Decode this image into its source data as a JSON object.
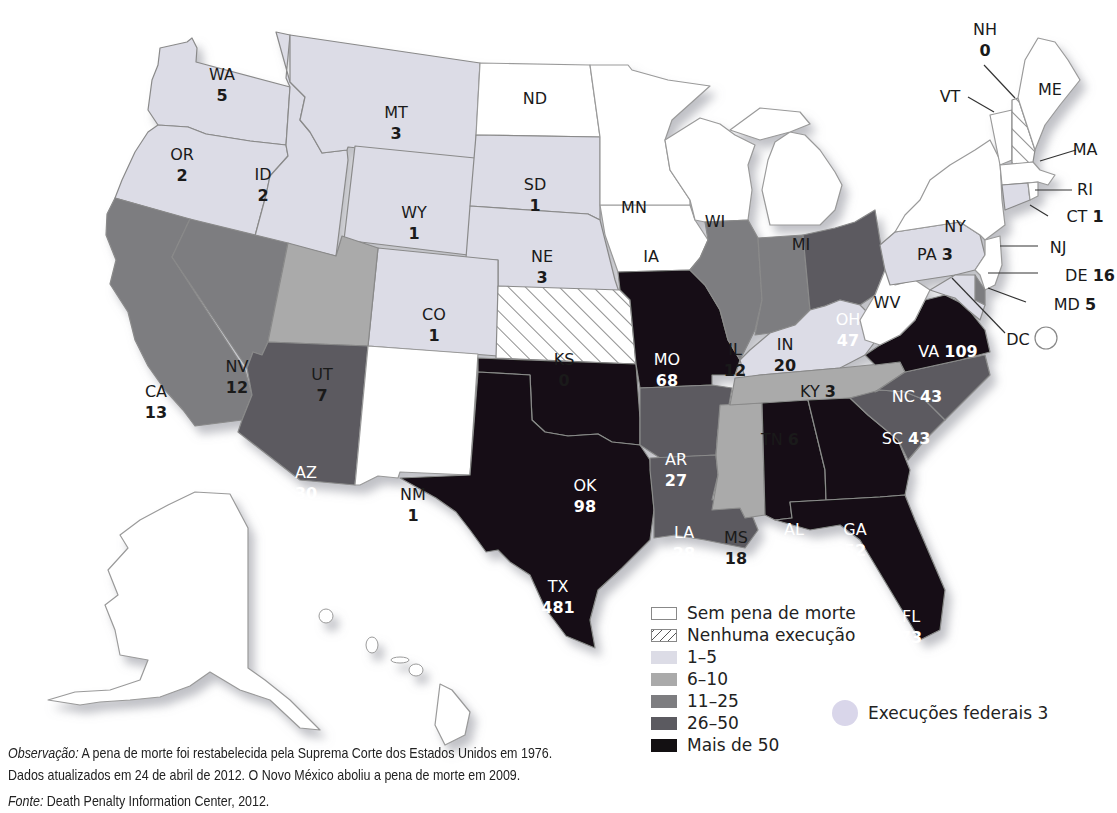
{
  "chart_data": {
    "type": "choropleth-map",
    "title": "",
    "legend": [
      {
        "key": "none",
        "label": "Sem pena de morte",
        "color": "#ffffff",
        "pattern": "none"
      },
      {
        "key": "zero",
        "label": "Nenhuma execução",
        "color": "#ffffff",
        "pattern": "hatch"
      },
      {
        "key": "c1",
        "label": "1–5",
        "color": "#dcdce6"
      },
      {
        "key": "c2",
        "label": "6–10",
        "color": "#aaaaaa"
      },
      {
        "key": "c3",
        "label": "11–25",
        "color": "#7d7d80"
      },
      {
        "key": "c4",
        "label": "26–50",
        "color": "#5b5a60"
      },
      {
        "key": "c5",
        "label": "Mais de 50",
        "color": "#131012"
      }
    ],
    "states": [
      {
        "code": "WA",
        "value": 5,
        "category": "1–5"
      },
      {
        "code": "OR",
        "value": 2,
        "category": "1–5"
      },
      {
        "code": "ID",
        "value": 2,
        "category": "1–5"
      },
      {
        "code": "MT",
        "value": 3,
        "category": "1–5"
      },
      {
        "code": "WY",
        "value": 1,
        "category": "1–5"
      },
      {
        "code": "SD",
        "value": 1,
        "category": "1–5"
      },
      {
        "code": "NE",
        "value": 3,
        "category": "1–5"
      },
      {
        "code": "CO",
        "value": 1,
        "category": "1–5"
      },
      {
        "code": "PA",
        "value": 3,
        "category": "1–5"
      },
      {
        "code": "KY",
        "value": 3,
        "category": "1–5"
      },
      {
        "code": "CT",
        "value": 1,
        "category": "1–5"
      },
      {
        "code": "MD",
        "value": 5,
        "category": "1–5"
      },
      {
        "code": "UT",
        "value": 7,
        "category": "6–10"
      },
      {
        "code": "TN",
        "value": 6,
        "category": "6–10"
      },
      {
        "code": "CA",
        "value": 13,
        "category": "11–25"
      },
      {
        "code": "NV",
        "value": 12,
        "category": "11–25"
      },
      {
        "code": "IL",
        "value": 12,
        "category": "11–25"
      },
      {
        "code": "IN",
        "value": 20,
        "category": "11–25"
      },
      {
        "code": "MS",
        "value": 18,
        "category": "11–25"
      },
      {
        "code": "DE",
        "value": 16,
        "category": "11–25"
      },
      {
        "code": "AZ",
        "value": 30,
        "category": "26–50"
      },
      {
        "code": "AR",
        "value": 27,
        "category": "26–50"
      },
      {
        "code": "LA",
        "value": 28,
        "category": "26–50"
      },
      {
        "code": "OH",
        "value": 47,
        "category": "26–50"
      },
      {
        "code": "NC",
        "value": 43,
        "category": "26–50"
      },
      {
        "code": "SC",
        "value": 43,
        "category": "26–50"
      },
      {
        "code": "MO",
        "value": 68,
        "category": "Mais de 50"
      },
      {
        "code": "OK",
        "value": 98,
        "category": "Mais de 50"
      },
      {
        "code": "TX",
        "value": 481,
        "category": "Mais de 50"
      },
      {
        "code": "AL",
        "value": 55,
        "category": "Mais de 50"
      },
      {
        "code": "GA",
        "value": 52,
        "category": "Mais de 50"
      },
      {
        "code": "FL",
        "value": 73,
        "category": "Mais de 50"
      },
      {
        "code": "VA",
        "value": 109,
        "category": "Mais de 50"
      },
      {
        "code": "KS",
        "value": 0,
        "category": "Nenhuma execução"
      },
      {
        "code": "NH",
        "value": 0,
        "category": "Nenhuma execução"
      },
      {
        "code": "NM",
        "value": 1,
        "category": "Sem pena de morte"
      },
      {
        "code": "ND",
        "value": null,
        "category": "Sem pena de morte"
      },
      {
        "code": "MN",
        "value": null,
        "category": "Sem pena de morte"
      },
      {
        "code": "WI",
        "value": null,
        "category": "Sem pena de morte"
      },
      {
        "code": "MI",
        "value": null,
        "category": "Sem pena de morte"
      },
      {
        "code": "IA",
        "value": null,
        "category": "Sem pena de morte"
      },
      {
        "code": "WV",
        "value": null,
        "category": "Sem pena de morte"
      },
      {
        "code": "NY",
        "value": null,
        "category": "Sem pena de morte"
      },
      {
        "code": "VT",
        "value": null,
        "category": "Sem pena de morte"
      },
      {
        "code": "ME",
        "value": null,
        "category": "Sem pena de morte"
      },
      {
        "code": "MA",
        "value": null,
        "category": "Sem pena de morte"
      },
      {
        "code": "RI",
        "value": null,
        "category": "Sem pena de morte"
      },
      {
        "code": "NJ",
        "value": null,
        "category": "Sem pena de morte"
      },
      {
        "code": "DC",
        "value": null,
        "category": "Sem pena de morte"
      },
      {
        "code": "AK",
        "value": null,
        "category": "Sem pena de morte"
      },
      {
        "code": "HI",
        "value": null,
        "category": "Sem pena de morte"
      }
    ],
    "federal_executions": 3
  },
  "labels": {
    "WA": {
      "code": "WA",
      "value": "5"
    },
    "OR": {
      "code": "OR",
      "value": "2"
    },
    "ID": {
      "code": "ID",
      "value": "2"
    },
    "MT": {
      "code": "MT",
      "value": "3"
    },
    "WY": {
      "code": "WY",
      "value": "1"
    },
    "SD": {
      "code": "SD",
      "value": "1"
    },
    "NE": {
      "code": "NE",
      "value": "3"
    },
    "CO": {
      "code": "CO",
      "value": "1"
    },
    "ND": {
      "code": "ND"
    },
    "MN": {
      "code": "MN"
    },
    "WI": {
      "code": "WI"
    },
    "MI": {
      "code": "MI"
    },
    "IA": {
      "code": "IA"
    },
    "NY": {
      "code": "NY"
    },
    "ME": {
      "code": "ME"
    },
    "VT": {
      "code": "VT"
    },
    "NH": {
      "code": "NH",
      "value": "0"
    },
    "MA": {
      "code": "MA"
    },
    "RI": {
      "code": "RI"
    },
    "CT": {
      "code": "CT",
      "value": "1"
    },
    "NJ": {
      "code": "NJ"
    },
    "DE": {
      "code": "DE",
      "value": "16"
    },
    "MD": {
      "code": "MD",
      "value": "5"
    },
    "DC": {
      "code": "DC"
    },
    "PA": {
      "code": "PA",
      "value": "3"
    },
    "WV": {
      "code": "WV"
    },
    "VA": {
      "code": "VA",
      "value": "109"
    },
    "KY": {
      "code": "KY",
      "value": "3"
    },
    "TN": {
      "code": "TN",
      "value": "6"
    },
    "NC": {
      "code": "NC",
      "value": "43"
    },
    "SC": {
      "code": "SC",
      "value": "43"
    },
    "OH": {
      "code": "OH",
      "value": "47"
    },
    "IN": {
      "code": "IN",
      "value": "20"
    },
    "IL": {
      "code": "IL",
      "value": "12"
    },
    "MO": {
      "code": "MO",
      "value": "68"
    },
    "KS": {
      "code": "KS",
      "value": "0"
    },
    "OK": {
      "code": "OK",
      "value": "98"
    },
    "AR": {
      "code": "AR",
      "value": "27"
    },
    "LA": {
      "code": "LA",
      "value": "28"
    },
    "MS": {
      "code": "MS",
      "value": "18"
    },
    "AL": {
      "code": "AL",
      "value": "55"
    },
    "GA": {
      "code": "GA",
      "value": "52"
    },
    "FL": {
      "code": "FL",
      "value": "73"
    },
    "TX": {
      "code": "TX",
      "value": "481"
    },
    "NM": {
      "code": "NM",
      "value": "1"
    },
    "AZ": {
      "code": "AZ",
      "value": "30"
    },
    "UT": {
      "code": "UT",
      "value": "7"
    },
    "NV": {
      "code": "NV",
      "value": "12"
    },
    "CA": {
      "code": "CA",
      "value": "13"
    },
    "AK": {
      "code": "AK"
    },
    "HI": {
      "code": "HI"
    }
  },
  "legend": {
    "items": [
      {
        "label": "Sem pena de morte"
      },
      {
        "label": "Nenhuma execução"
      },
      {
        "label": "1–5"
      },
      {
        "label": "6–10"
      },
      {
        "label": "11–25"
      },
      {
        "label": "26–50"
      },
      {
        "label": "Mais de 50"
      }
    ],
    "federal": "Execuções federais 3"
  },
  "notes": {
    "obs_label": "Observação:",
    "obs_text": " A pena de morte foi restabelecida pela Suprema Corte dos Estados Unidos em 1976.",
    "line2": "Dados atualizados em 24 de abril de 2012. O Novo México aboliu a pena de morte em 2009.",
    "source_label": "Fonte:",
    "source_text": " Death Penalty Information Center, 2012."
  },
  "colors": {
    "none": "#ffffff",
    "c1": "#dcdce6",
    "c2": "#aaaaaa",
    "c3": "#7d7d80",
    "c4": "#5b5a60",
    "c5": "#131012"
  }
}
